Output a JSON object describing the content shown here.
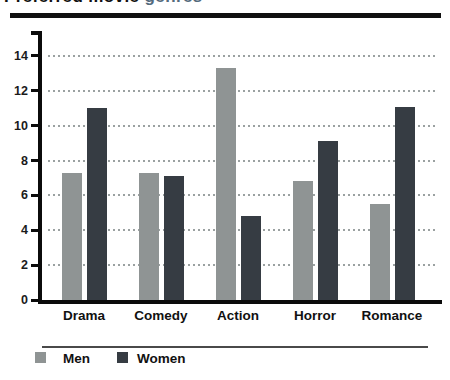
{
  "title": {
    "prefix": "Preferred movie",
    "highlight": "genres",
    "full": "Preferred movie genres",
    "highlight_color": "#546b7d"
  },
  "chart_data": {
    "type": "bar",
    "categories": [
      "Drama",
      "Comedy",
      "Action",
      "Horror",
      "Romance"
    ],
    "series": [
      {
        "name": "Men",
        "color": "#8f9494",
        "values": [
          7.3,
          7.3,
          13.3,
          6.8,
          5.5
        ]
      },
      {
        "name": "Women",
        "color": "#363c43",
        "values": [
          11.0,
          7.1,
          4.8,
          9.1,
          11.1
        ]
      }
    ],
    "xlabel": "",
    "ylabel": "",
    "ylim": [
      0,
      15.5
    ],
    "yticks": [
      0,
      2,
      4,
      6,
      8,
      10,
      12,
      14
    ],
    "grid": "horizontal-dotted",
    "grid_color": "#9ba1a1",
    "axis_color": "#0b0b0b",
    "legend_position": "bottom-left"
  }
}
